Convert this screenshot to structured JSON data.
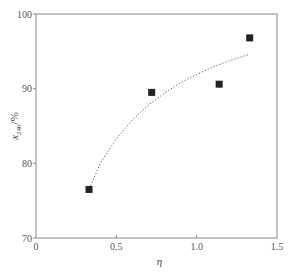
{
  "chart_data": {
    "type": "scatter",
    "title": "",
    "xlabel": "η",
    "ylabel": "x240/%",
    "ylabel_main": "x",
    "ylabel_sub": "240",
    "ylabel_unit": "/%",
    "xlim": [
      0,
      1.5
    ],
    "ylim": [
      70,
      100
    ],
    "xticks": [
      0,
      0.5,
      1.0,
      1.5
    ],
    "xtick_labels": [
      "0",
      "0.5",
      "1.0",
      "1.5"
    ],
    "yticks": [
      70,
      80,
      90,
      100
    ],
    "ytick_labels": [
      "70",
      "80",
      "90",
      "100"
    ],
    "grid": false,
    "legend": null,
    "series": [
      {
        "name": "measured",
        "marker": "square",
        "color": "#222222",
        "x": [
          0.33,
          0.72,
          1.14,
          1.33
        ],
        "y": [
          76.5,
          89.5,
          90.6,
          96.8
        ]
      },
      {
        "name": "fit",
        "style": "dotted",
        "color": "#555555",
        "x": [
          0.34,
          0.4,
          0.5,
          0.6,
          0.7,
          0.8,
          0.9,
          1.0,
          1.1,
          1.2,
          1.33
        ],
        "y": [
          77.0,
          80.0,
          83.3,
          85.8,
          87.8,
          89.4,
          90.8,
          91.9,
          92.9,
          93.7,
          94.6
        ]
      }
    ]
  }
}
